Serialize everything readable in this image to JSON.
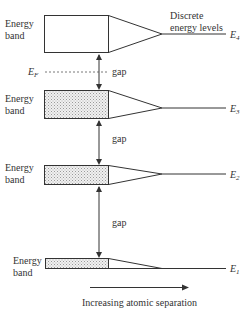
{
  "diagram": {
    "type": "energy-band-diagram",
    "colors": {
      "line": "#333333",
      "band_fill_filled": "#dcdcdc",
      "band_fill_empty": "#ffffff",
      "background": "#ffffff"
    },
    "bands": [
      {
        "id": "band-4",
        "label_line1": "Energy",
        "label_line2": "band",
        "level_symbol": "E",
        "level_sub": "4",
        "filled": false
      },
      {
        "id": "band-3",
        "label_line1": "Energy",
        "label_line2": "band",
        "level_symbol": "E",
        "level_sub": "3",
        "filled": true
      },
      {
        "id": "band-2",
        "label_line1": "Energy",
        "label_line2": "band",
        "level_symbol": "E",
        "level_sub": "2",
        "filled": true
      },
      {
        "id": "band-1",
        "label_line1": "Energy",
        "label_line2": "band",
        "level_symbol": "E",
        "level_sub": "1",
        "filled": true
      }
    ],
    "gaps": [
      {
        "label": "gap"
      },
      {
        "label": "gap"
      },
      {
        "label": "gap"
      }
    ],
    "fermi_level": {
      "symbol": "E",
      "sub": "F"
    },
    "discrete_label": {
      "line1": "Discrete",
      "line2": "energy levels"
    },
    "x_axis": {
      "label": "Increasing atomic separation"
    }
  }
}
